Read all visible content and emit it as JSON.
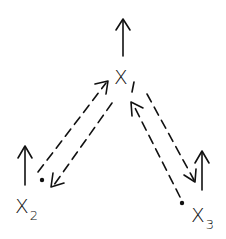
{
  "diagram": {
    "type": "node-graph",
    "stroke_color": "#111111",
    "background": "#ffffff",
    "nodes": [
      {
        "id": "x1",
        "label": "X",
        "subscript": "1",
        "has_up_arrow": true,
        "has_dot": false
      },
      {
        "id": "x2",
        "label": "X",
        "subscript": "2",
        "has_up_arrow": true,
        "has_dot": true
      },
      {
        "id": "x3",
        "label": "X",
        "subscript": "3",
        "has_up_arrow": true,
        "has_dot": true
      }
    ],
    "edges": [
      {
        "from": "x2",
        "to": "x1",
        "style": "dashed",
        "arrow": "end"
      },
      {
        "from": "x1",
        "to": "x2",
        "style": "dashed",
        "arrow": "end"
      },
      {
        "from": "x3",
        "to": "x1",
        "style": "dashed",
        "arrow": "end"
      },
      {
        "from": "x1",
        "to": "x3",
        "style": "dashed",
        "arrow": "end"
      }
    ]
  }
}
